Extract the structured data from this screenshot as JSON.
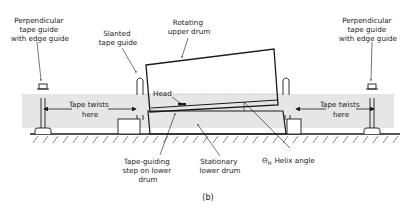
{
  "figure": {
    "caption": "(b)",
    "labels": {
      "left_guide": [
        "Perpendicular",
        "tape guide",
        "with edge guide"
      ],
      "slanted_guide": [
        "Slanted",
        "tape guide"
      ],
      "upper_drum": [
        "Rotating",
        "upper drum"
      ],
      "right_guide": [
        "Perpendicular",
        "tape guide",
        "with edge guide"
      ],
      "tape_twists_left": [
        "Tape twists",
        "here"
      ],
      "tape_twists_right": [
        "Tape twists",
        "here"
      ],
      "head": "Head",
      "step": [
        "Tape-guiding",
        "step on lower",
        "drum"
      ],
      "lower_drum": [
        "Stationary",
        "lower drum"
      ],
      "helix_symbol": "Θ",
      "helix_sub": "H",
      "helix_text": "Helix angle"
    },
    "colors": {
      "tape_band": "#e6e6e6",
      "ink": "#1a1a1a",
      "background": "#ffffff"
    }
  }
}
